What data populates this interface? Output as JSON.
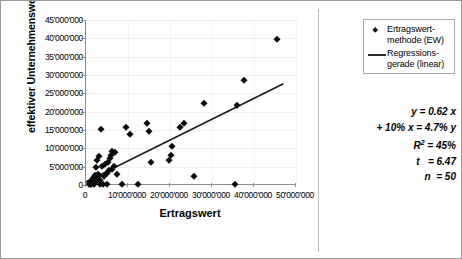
{
  "chart_data": {
    "type": "scatter",
    "title": "",
    "xlabel": "Ertragswert",
    "ylabel": "effektiver Unternehmenswert",
    "xlim": [
      0,
      50000000
    ],
    "ylim": [
      0,
      45000000
    ],
    "x_ticks": [
      "0",
      "10'000'000",
      "20'000'000",
      "30'000'000",
      "40'000'000",
      "50'000'000"
    ],
    "x_tick_values": [
      0,
      10000000,
      20000000,
      30000000,
      40000000,
      50000000
    ],
    "y_ticks": [
      "0",
      "5'000'000",
      "10'000'000",
      "15'000'000",
      "20'000'000",
      "25'000'000",
      "30'000'000",
      "35'000'000",
      "40'000'000",
      "45'000'000"
    ],
    "y_tick_values": [
      0,
      5000000,
      10000000,
      15000000,
      20000000,
      25000000,
      30000000,
      35000000,
      40000000,
      45000000
    ],
    "grid": true,
    "legend_position": "top-right",
    "series": [
      {
        "name": "Ertragswertmethode (EW)",
        "marker": "diamond",
        "color": "#0d0d0d",
        "points": [
          [
            700000,
            300000
          ],
          [
            900000,
            700000
          ],
          [
            1100000,
            400000
          ],
          [
            1200000,
            1200000
          ],
          [
            1300000,
            200000
          ],
          [
            1500000,
            900000
          ],
          [
            1600000,
            1800000
          ],
          [
            1700000,
            500000
          ],
          [
            1800000,
            2100000
          ],
          [
            1900000,
            1400000
          ],
          [
            2000000,
            300000
          ],
          [
            2100000,
            2600000
          ],
          [
            2200000,
            800000
          ],
          [
            2400000,
            4900000
          ],
          [
            2500000,
            6800000
          ],
          [
            2600000,
            1900000
          ],
          [
            2800000,
            3000000
          ],
          [
            3000000,
            7900000
          ],
          [
            3100000,
            2700000
          ],
          [
            3300000,
            1400000
          ],
          [
            3400000,
            300000
          ],
          [
            3600000,
            15300000
          ],
          [
            3900000,
            5100000
          ],
          [
            4100000,
            300000
          ],
          [
            4300000,
            2400000
          ],
          [
            4600000,
            5600000
          ],
          [
            4900000,
            3400000
          ],
          [
            5100000,
            300000
          ],
          [
            5300000,
            6300000
          ],
          [
            5500000,
            4200000
          ],
          [
            5700000,
            7400000
          ],
          [
            5900000,
            8300000
          ],
          [
            6100000,
            9300000
          ],
          [
            6300000,
            4300000
          ],
          [
            6600000,
            5300000
          ],
          [
            6900000,
            8900000
          ],
          [
            7400000,
            3100000
          ],
          [
            8600000,
            300000
          ],
          [
            9600000,
            15900000
          ],
          [
            10400000,
            13800000
          ],
          [
            12400000,
            300000
          ],
          [
            14600000,
            16800000
          ],
          [
            15100000,
            14800000
          ],
          [
            15400000,
            6200000
          ],
          [
            19800000,
            6900000
          ],
          [
            20200000,
            8300000
          ],
          [
            20400000,
            10700000
          ],
          [
            22300000,
            15900000
          ],
          [
            23300000,
            16900000
          ],
          [
            25600000,
            2400000
          ],
          [
            28100000,
            22500000
          ],
          [
            35500000,
            300000
          ],
          [
            36000000,
            21800000
          ],
          [
            37500000,
            28600000
          ],
          [
            45500000,
            39700000
          ]
        ]
      },
      {
        "name": "Regressionsgerade (linear)",
        "type": "line",
        "color": "#1a1a1a",
        "endpoints": [
          [
            0,
            900000
          ],
          [
            47000000,
            27600000
          ]
        ],
        "slope": 0.62,
        "intercept": 900000
      }
    ],
    "annotations": {
      "equation": "y = 0.62 x",
      "elasticity": "+ 10% x = 4.7% y",
      "r_squared_label": "R",
      "r_squared_sup": "2",
      "r_squared_value": "=  45%",
      "t_label": "t",
      "t_value": "=  6.47",
      "n_label": "n",
      "n_value": "=  50"
    }
  },
  "legend": {
    "items": [
      {
        "label_line1": "Ertragswert-",
        "label_line2": "methode (EW)",
        "key": "diamond-marker"
      },
      {
        "label_line1": "Regressions-",
        "label_line2": "gerade (linear)",
        "key": "line-marker"
      }
    ]
  },
  "stats": {
    "line1": "y = 0.62 x",
    "line2": "+ 10% x = 4.7% y",
    "line3_label": "R",
    "line3_sup": "2",
    "line3_value": "=  45%",
    "line4_label": "t",
    "line4_value": "=  6.47",
    "line5_label": "n",
    "line5_value": "=  50"
  }
}
